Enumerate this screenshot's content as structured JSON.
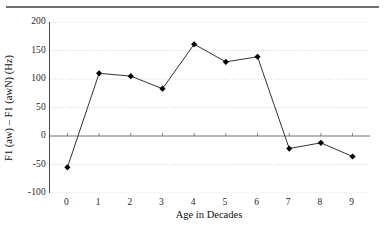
{
  "chart_data": {
    "type": "line",
    "title": "",
    "xlabel": "Age in Decades",
    "ylabel": "F1 (aw) – F1 (awN) (Hz)",
    "x": [
      0,
      1,
      2,
      3,
      4,
      5,
      6,
      7,
      8,
      9
    ],
    "values": [
      -55,
      110,
      105,
      83,
      161,
      130,
      139,
      -22,
      -12,
      -36
    ],
    "series": [
      {
        "name": "F1 (aw) – F1 (awN)",
        "values": [
          -55,
          110,
          105,
          83,
          161,
          130,
          139,
          -22,
          -12,
          -36
        ]
      }
    ],
    "xlim": [
      -0.55,
      9.55
    ],
    "ylim": [
      -100,
      200
    ],
    "ytick_labels": [
      "200",
      "150",
      "100",
      "50",
      "0",
      "-50",
      "-100"
    ],
    "ytick_values": [
      200,
      150,
      100,
      50,
      0,
      -50,
      -100
    ],
    "xtick_labels": [
      "0",
      "1",
      "2",
      "3",
      "4",
      "5",
      "6",
      "7",
      "8",
      "9"
    ],
    "grid": true,
    "grid_style": "dotted-horizontal",
    "legend": "none",
    "marker": "diamond",
    "marker_color": "#000000",
    "line_color": "#333333",
    "zero_line": true,
    "background_color": "#ffffff",
    "grid_color": "#c9c9c9",
    "axis_color": "#4a4a4a"
  }
}
